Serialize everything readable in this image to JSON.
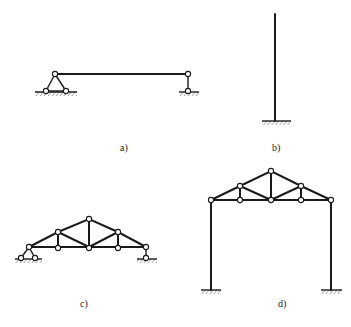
{
  "figure": {
    "panels": [
      {
        "id": "a",
        "label": "a)",
        "description": "Simply supported beam with triangular pinned support on left and vertical link support on right"
      },
      {
        "id": "b",
        "label": "b)",
        "description": "Cantilever column fixed at base"
      },
      {
        "id": "c",
        "label": "c)",
        "description": "Triangular roof truss on pin and roller-link supports"
      },
      {
        "id": "d",
        "label": "d)",
        "description": "Portal frame with roof truss on fixed-base columns"
      }
    ]
  },
  "colors": {
    "line": "#1a1a1a",
    "background": "#ffffff",
    "pin_fill": "#ffffff"
  }
}
